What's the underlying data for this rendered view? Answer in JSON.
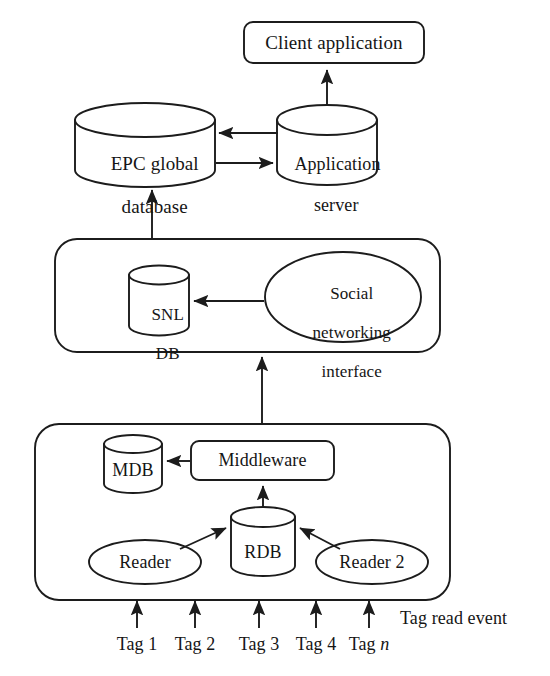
{
  "diagram": {
    "stroke_color": "#1c1c1c",
    "fill_color": "#ffffff",
    "nodes": {
      "client_application": {
        "label": "Client application",
        "shape": "rounded-rect"
      },
      "epc_global_database": {
        "label_line1": "EPC global",
        "label_line2": "database",
        "shape": "cylinder"
      },
      "application_server": {
        "label_line1": "Application",
        "label_line2": "server",
        "shape": "cylinder"
      },
      "snl_db": {
        "label_line1": "SNL",
        "label_line2": "DB",
        "shape": "cylinder"
      },
      "social_networking_interface": {
        "label_line1": "Social",
        "label_line2": "networking",
        "label_line3": "interface",
        "shape": "ellipse"
      },
      "mdb": {
        "label": "MDB",
        "shape": "cylinder"
      },
      "middleware": {
        "label": "Middleware",
        "shape": "rounded-rect"
      },
      "rdb": {
        "label": "RDB",
        "shape": "cylinder"
      },
      "reader_1": {
        "label": "Reader",
        "shape": "ellipse"
      },
      "reader_2": {
        "label": "Reader 2",
        "shape": "ellipse"
      }
    },
    "containers": {
      "middle_layer": {
        "shape": "rounded-rect"
      },
      "bottom_layer": {
        "shape": "rounded-rect"
      }
    },
    "tags": [
      {
        "label": "Tag 1"
      },
      {
        "label": "Tag 2"
      },
      {
        "label": "Tag 3"
      },
      {
        "label": "Tag 4"
      },
      {
        "label_prefix": "Tag ",
        "label_italic": "n"
      }
    ],
    "annotations": {
      "tag_read_event": "Tag read event"
    },
    "edges": [
      {
        "from": "application_server",
        "to": "client_application",
        "direction": "up"
      },
      {
        "from": "application_server",
        "to": "epc_global_database",
        "direction": "left"
      },
      {
        "from": "epc_global_database",
        "to": "application_server",
        "direction": "right"
      },
      {
        "from": "middle_layer",
        "to": "epc_global_database",
        "direction": "up"
      },
      {
        "from": "social_networking_interface",
        "to": "snl_db",
        "direction": "left"
      },
      {
        "from": "bottom_layer",
        "to": "middle_layer",
        "direction": "up"
      },
      {
        "from": "middleware",
        "to": "mdb",
        "direction": "left"
      },
      {
        "from": "rdb",
        "to": "middleware",
        "direction": "up"
      },
      {
        "from": "reader_1",
        "to": "rdb",
        "direction": "up-right"
      },
      {
        "from": "reader_2",
        "to": "rdb",
        "direction": "up-left"
      }
    ]
  }
}
